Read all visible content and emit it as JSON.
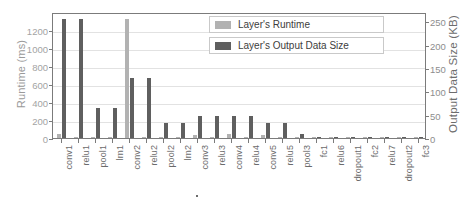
{
  "chart_data": {
    "type": "bar",
    "title": "",
    "xlabel": "",
    "ylabel": "Runtime (ms)",
    "y2label": "Output Data Size (KB)",
    "ylim": [
      0,
      1400
    ],
    "y2lim": [
      0,
      270
    ],
    "yticks": [
      0,
      200,
      400,
      600,
      800,
      1000,
      1200
    ],
    "y2ticks": [
      0,
      50,
      100,
      150,
      200,
      250
    ],
    "grid": true,
    "legend_position": "upper-center",
    "categories": [
      "conv1",
      "relu1",
      "pool1",
      "lrn1",
      "conv2",
      "relu2",
      "pool2",
      "lrn2",
      "conv3",
      "relu3",
      "conv4",
      "relu4",
      "conv5",
      "relu5",
      "pool3",
      "fc1",
      "relu6",
      "dropout1",
      "fc2",
      "relu7",
      "dropout2",
      "fc3"
    ],
    "series": [
      {
        "name": "Layer's Runtime",
        "unit": "ms",
        "axis": "left",
        "color": "#b2b2b2",
        "values": [
          45,
          2,
          3,
          2,
          1320,
          4,
          2,
          2,
          30,
          3,
          50,
          3,
          33,
          3,
          2,
          8,
          1,
          1,
          3,
          1,
          1,
          1
        ]
      },
      {
        "name": "Layer's Output Data Size",
        "unit": "KB",
        "axis": "right",
        "color": "#5f5f5f",
        "values": [
          256,
          256,
          64,
          64,
          128,
          128,
          32,
          32,
          48,
          48,
          48,
          48,
          32,
          32,
          8,
          1.6,
          1.6,
          1.6,
          1.6,
          1.6,
          1.6,
          0.4
        ]
      }
    ],
    "annotations": [
      {
        "label": "",
        "at_category": "conv3",
        "type": "dot-marker"
      }
    ]
  },
  "legend": {
    "items": [
      {
        "label": "Layer's Runtime",
        "swatch": "runtime"
      },
      {
        "label": "Layer's Output Data Size",
        "swatch": "datasize"
      }
    ]
  },
  "colors": {
    "runtime": "#b2b2b2",
    "datasize": "#5f5f5f",
    "axis": "#7b7b7b",
    "grid": "#e2e2e2",
    "text": "#6b6b6b"
  }
}
